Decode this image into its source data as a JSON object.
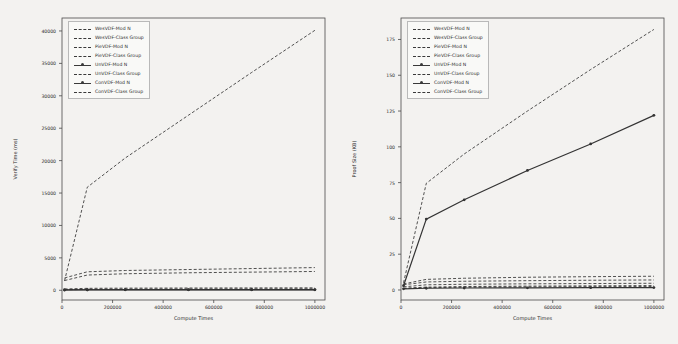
{
  "figure": {
    "background": "#f2f1ef",
    "panel_count": 2
  },
  "chart_data": [
    {
      "type": "line",
      "panel": "left",
      "title": "",
      "xlabel": "Compute Times",
      "ylabel": "Verify Time (ms)",
      "xlim": [
        0,
        1040000
      ],
      "ylim": [
        -1500,
        42000
      ],
      "xticks": [
        0,
        200000,
        400000,
        600000,
        800000,
        1000000
      ],
      "xticklabels": [
        "0",
        "200000",
        "400000",
        "600000",
        "800000",
        "1000000"
      ],
      "yticks": [
        0,
        5000,
        10000,
        15000,
        20000,
        25000,
        30000,
        35000,
        40000
      ],
      "yticklabels": [
        "0",
        "5000",
        "10000",
        "15000",
        "20000",
        "25000",
        "30000",
        "35000",
        "40000"
      ],
      "grid": false,
      "legend_position": "upper left",
      "x": [
        10000,
        100000,
        250000,
        500000,
        750000,
        1000000
      ],
      "series": [
        {
          "name": "WesVDF-Mod N",
          "style": "dashed",
          "marker": false,
          "values": [
            110,
            150,
            170,
            185,
            195,
            205
          ]
        },
        {
          "name": "WesVDF-Class Group",
          "style": "dashed",
          "marker": false,
          "values": [
            1450,
            15900,
            20400,
            27000,
            33600,
            40100
          ]
        },
        {
          "name": "PieVDF-Mod N",
          "style": "dashed",
          "marker": false,
          "values": [
            90,
            130,
            150,
            160,
            170,
            180
          ]
        },
        {
          "name": "PieVDF-Class Group",
          "style": "dashed",
          "marker": false,
          "values": [
            1900,
            2850,
            3050,
            3200,
            3350,
            3500
          ]
        },
        {
          "name": "UnVDF-Mod N",
          "style": "solid",
          "marker": true,
          "values": [
            60,
            80,
            90,
            95,
            100,
            105
          ]
        },
        {
          "name": "UnVDF-Class Group",
          "style": "dashed",
          "marker": false,
          "values": [
            1500,
            2350,
            2550,
            2700,
            2800,
            2900
          ]
        },
        {
          "name": "ConVDF-Mod N",
          "style": "solid",
          "marker": true,
          "values": [
            40,
            55,
            62,
            66,
            70,
            74
          ]
        },
        {
          "name": "ConVDF-Class Group",
          "style": "dashed",
          "marker": false,
          "values": [
            200,
            300,
            330,
            350,
            365,
            380
          ]
        }
      ]
    },
    {
      "type": "line",
      "panel": "right",
      "title": "",
      "xlabel": "Compute Times",
      "ylabel": "Proof Size (KB)",
      "xlim": [
        0,
        1040000
      ],
      "ylim": [
        -7,
        190
      ],
      "xticks": [
        0,
        200000,
        400000,
        600000,
        800000,
        1000000
      ],
      "xticklabels": [
        "0",
        "200000",
        "400000",
        "600000",
        "800000",
        "1000000"
      ],
      "yticks": [
        0,
        25,
        50,
        75,
        100,
        125,
        150,
        175
      ],
      "yticklabels": [
        "0",
        "25",
        "50",
        "75",
        "100",
        "125",
        "150",
        "175"
      ],
      "grid": false,
      "legend_position": "upper left",
      "x": [
        10000,
        100000,
        250000,
        500000,
        750000,
        1000000
      ],
      "series": [
        {
          "name": "WesVDF-Mod N",
          "style": "dashed",
          "marker": false,
          "values": [
            1.2,
            2.0,
            2.4,
            2.7,
            2.9,
            3.1
          ]
        },
        {
          "name": "WesVDF-Class Group",
          "style": "dashed",
          "marker": false,
          "values": [
            5.0,
            74.5,
            95.0,
            125.0,
            154.0,
            182.0
          ]
        },
        {
          "name": "PieVDF-Mod N",
          "style": "dashed",
          "marker": false,
          "values": [
            1.0,
            1.6,
            1.9,
            2.1,
            2.3,
            2.4
          ]
        },
        {
          "name": "PieVDF-Class Group",
          "style": "dashed",
          "marker": false,
          "values": [
            4.2,
            7.4,
            8.2,
            8.9,
            9.3,
            9.6
          ]
        },
        {
          "name": "UnVDF-Mod N",
          "style": "solid",
          "marker": true,
          "values": [
            0.8,
            1.2,
            1.4,
            1.5,
            1.6,
            1.7
          ]
        },
        {
          "name": "UnVDF-Class Group",
          "style": "dashed",
          "marker": false,
          "values": [
            3.6,
            5.6,
            6.1,
            6.5,
            6.8,
            7.0
          ]
        },
        {
          "name": "ConVDF-Mod N",
          "style": "solid",
          "marker": true,
          "values": [
            3.0,
            49.5,
            63.0,
            83.5,
            102.0,
            122.0
          ]
        },
        {
          "name": "ConVDF-Class Group",
          "style": "dashed",
          "marker": false,
          "values": [
            2.2,
            3.6,
            4.0,
            4.3,
            4.5,
            4.7
          ]
        }
      ]
    }
  ]
}
